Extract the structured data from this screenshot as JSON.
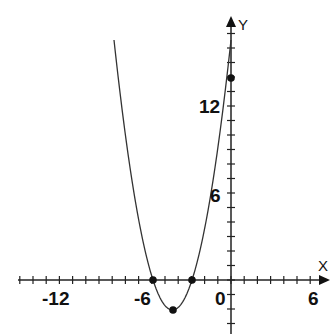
{
  "chart_data": {
    "type": "line",
    "title": "",
    "xlabel": "X",
    "ylabel": "Y",
    "x_ticks": [
      "-12",
      "-6",
      "0",
      "6"
    ],
    "y_ticks": [
      "6",
      "12"
    ],
    "xlim": [
      -15,
      6.5
    ],
    "ylim": [
      -3,
      18
    ],
    "grid": false,
    "series": [
      {
        "name": "parabola",
        "equation_approx": "y = (x+5.7)(x+2.8)",
        "points": [
          {
            "x": -5.7,
            "y": 0,
            "label": "root"
          },
          {
            "x": -2.8,
            "y": 0,
            "label": "root"
          },
          {
            "x": -4.25,
            "y": -2.1,
            "label": "vertex"
          },
          {
            "x": 0,
            "y": 14,
            "label": "y-intercept"
          }
        ]
      }
    ]
  },
  "labels": {
    "x_axis": "X",
    "y_axis": "Y",
    "tick_m12": "-12",
    "tick_m6": "-6",
    "tick_0": "0",
    "tick_6": "6",
    "tick_y6": "6",
    "tick_y12": "12"
  }
}
